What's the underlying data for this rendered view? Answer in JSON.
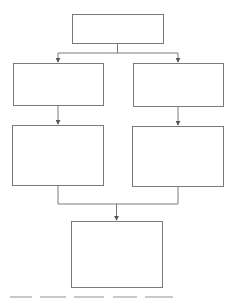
{
  "diagram": {
    "type": "flowchart",
    "stroke_color": "#7a7a7a",
    "background": "#ffffff",
    "nodes": [
      {
        "id": "top",
        "label": "",
        "x": 72,
        "y": 14,
        "w": 91,
        "h": 29
      },
      {
        "id": "left-1",
        "label": "",
        "x": 13,
        "y": 63,
        "w": 90,
        "h": 42
      },
      {
        "id": "right-1",
        "label": "",
        "x": 133,
        "y": 63,
        "w": 90,
        "h": 43
      },
      {
        "id": "left-2",
        "label": "",
        "x": 12,
        "y": 125,
        "w": 91,
        "h": 60
      },
      {
        "id": "right-2",
        "label": "",
        "x": 132,
        "y": 126,
        "w": 91,
        "h": 60
      },
      {
        "id": "bottom",
        "label": "",
        "x": 71,
        "y": 221,
        "w": 91,
        "h": 66
      }
    ],
    "edges": [
      {
        "from": "top",
        "to": "left-1"
      },
      {
        "from": "top",
        "to": "right-1"
      },
      {
        "from": "left-1",
        "to": "left-2"
      },
      {
        "from": "right-1",
        "to": "right-2"
      },
      {
        "from": "left-2",
        "to": "bottom"
      },
      {
        "from": "right-2",
        "to": "bottom"
      }
    ]
  },
  "caption": {
    "text": ""
  }
}
